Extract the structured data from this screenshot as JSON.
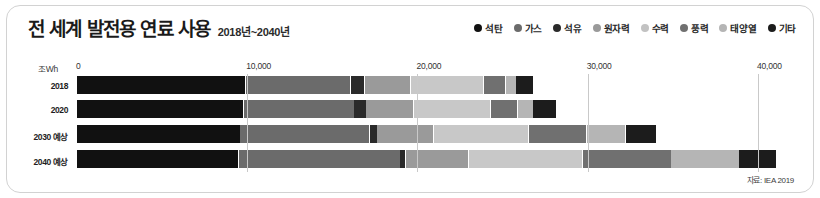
{
  "header": {
    "title": "전 세계 발전용 연료 사용",
    "subtitle": "2018년~2040년"
  },
  "legend": {
    "items": [
      {
        "label": "석탄",
        "color": "#111111",
        "icon": "legend-dot-icon"
      },
      {
        "label": "가스",
        "color": "#6b6b6b",
        "icon": "legend-dot-icon"
      },
      {
        "label": "석유",
        "color": "#2a2a2a",
        "icon": "legend-dot-icon"
      },
      {
        "label": "원자력",
        "color": "#9a9a9a",
        "icon": "legend-dot-icon"
      },
      {
        "label": "수력",
        "color": "#c2c2c2",
        "icon": "legend-dot-icon"
      },
      {
        "label": "풍력",
        "color": "#707070",
        "icon": "legend-dot-icon"
      },
      {
        "label": "태양열",
        "color": "#b5b5b5",
        "icon": "legend-dot-icon"
      },
      {
        "label": "기타",
        "color": "#1c1c1c",
        "icon": "legend-dot-icon"
      }
    ]
  },
  "axis": {
    "unit": "조Wh",
    "ticks": [
      "0",
      "10,000",
      "20,000",
      "30,000",
      "40,000"
    ],
    "tick_values": [
      0,
      10000,
      20000,
      30000,
      40000
    ]
  },
  "source": "자료: IEA 2019",
  "chart_data": {
    "type": "bar",
    "orientation": "horizontal",
    "stacked": true,
    "title": "전 세계 발전용 연료 사용",
    "subtitle": "2018년~2040년",
    "xlabel": "조Wh",
    "ylabel": "",
    "xlim": [
      0,
      42000
    ],
    "grid": true,
    "legend_position": "top-right",
    "categories": [
      "2018",
      "2020",
      "2030 예상",
      "2040 예상"
    ],
    "series": [
      {
        "name": "석탄",
        "color": "#111111",
        "texture": "plain",
        "values": [
          9900,
          9800,
          9600,
          9500
        ]
      },
      {
        "name": "가스",
        "color": "#6b6b6b",
        "texture": "brick",
        "values": [
          6200,
          6500,
          7600,
          9500
        ]
      },
      {
        "name": "석유",
        "color": "#2a2a2a",
        "texture": "hline",
        "values": [
          800,
          700,
          450,
          300
        ]
      },
      {
        "name": "원자력",
        "color": "#9a9a9a",
        "texture": "diag",
        "values": [
          2700,
          2800,
          3300,
          3700
        ]
      },
      {
        "name": "수력",
        "color": "#c8c8c8",
        "texture": "dot",
        "values": [
          4300,
          4500,
          5600,
          6700
        ]
      },
      {
        "name": "풍력",
        "color": "#707070",
        "texture": "plain",
        "values": [
          1300,
          1600,
          3400,
          5200
        ]
      },
      {
        "name": "태양열",
        "color": "#b5b5b5",
        "texture": "plain",
        "values": [
          600,
          900,
          2300,
          4000
        ]
      },
      {
        "name": "기타",
        "color": "#1c1c1c",
        "texture": "hline",
        "values": [
          1000,
          1400,
          1800,
          2200
        ]
      }
    ],
    "totals": [
      26800,
      28200,
      34050,
      41100
    ]
  }
}
